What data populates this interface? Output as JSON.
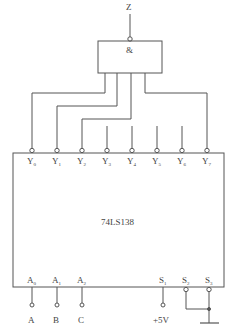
{
  "diagram": {
    "gate": {
      "output_label": "Z",
      "symbol": "&"
    },
    "chip": {
      "name": "74LS138"
    },
    "outputs": [
      {
        "base": "Y",
        "sub": "0",
        "to_gate": true
      },
      {
        "base": "Y",
        "sub": "1",
        "to_gate": true
      },
      {
        "base": "Y",
        "sub": "2",
        "to_gate": true
      },
      {
        "base": "Y",
        "sub": "3",
        "to_gate": false
      },
      {
        "base": "Y",
        "sub": "4",
        "to_gate": false
      },
      {
        "base": "Y",
        "sub": "5",
        "to_gate": false
      },
      {
        "base": "Y",
        "sub": "6",
        "to_gate": false
      },
      {
        "base": "Y",
        "sub": "7",
        "to_gate": true
      }
    ],
    "address_inputs": [
      {
        "base": "A",
        "sub": "0",
        "signal": "A"
      },
      {
        "base": "A",
        "sub": "1",
        "signal": "B"
      },
      {
        "base": "A",
        "sub": "2",
        "signal": "C"
      }
    ],
    "enable_inputs": [
      {
        "base": "S",
        "sub": "1",
        "signal": "+5V"
      },
      {
        "base": "S",
        "sub": "2",
        "signal": "GND"
      },
      {
        "base": "S",
        "sub": "3",
        "signal": "GND"
      }
    ],
    "colors": {
      "line": "#555555",
      "text": "#444444"
    }
  }
}
